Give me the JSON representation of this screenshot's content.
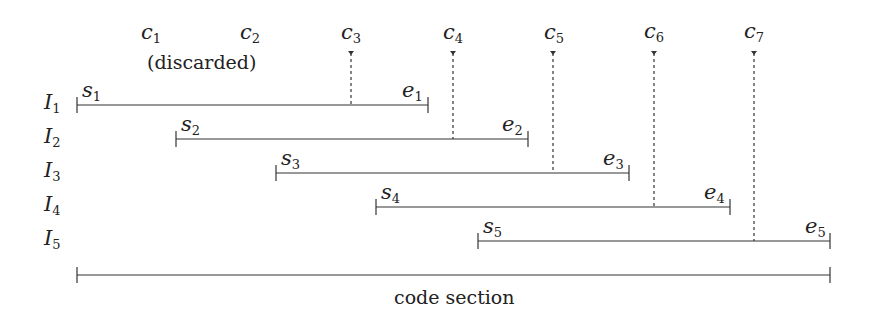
{
  "diagram": {
    "bottom_label": "code section",
    "discarded_note": "(discarded)",
    "checkpoints": [
      {
        "name": "c",
        "sub": "1",
        "x": 152,
        "dashed": false
      },
      {
        "name": "c",
        "sub": "2",
        "x": 251,
        "dashed": false
      },
      {
        "name": "c",
        "sub": "3",
        "x": 351,
        "dashed": true
      },
      {
        "name": "c",
        "sub": "4",
        "x": 453,
        "dashed": true
      },
      {
        "name": "c",
        "sub": "5",
        "x": 553,
        "dashed": true
      },
      {
        "name": "c",
        "sub": "6",
        "x": 654,
        "dashed": true
      },
      {
        "name": "c",
        "sub": "7",
        "x": 754,
        "dashed": true
      }
    ],
    "intervals": [
      {
        "label": "I",
        "sub": "1",
        "start": "s",
        "start_sub": "1",
        "end": "e",
        "end_sub": "1",
        "x1": 77,
        "x2": 428,
        "y": 105
      },
      {
        "label": "I",
        "sub": "2",
        "start": "s",
        "start_sub": "2",
        "end": "e",
        "end_sub": "2",
        "x1": 176,
        "x2": 528,
        "y": 139
      },
      {
        "label": "I",
        "sub": "3",
        "start": "s",
        "start_sub": "3",
        "end": "e",
        "end_sub": "3",
        "x1": 276,
        "x2": 629,
        "y": 173
      },
      {
        "label": "I",
        "sub": "4",
        "start": "s",
        "start_sub": "4",
        "end": "e",
        "end_sub": "4",
        "x1": 376,
        "x2": 730,
        "y": 207
      },
      {
        "label": "I",
        "sub": "5",
        "start": "s",
        "start_sub": "5",
        "end": "e",
        "end_sub": "5",
        "x1": 478,
        "x2": 830,
        "y": 241
      }
    ],
    "code_section": {
      "x1": 77,
      "x2": 830,
      "y": 275
    }
  }
}
